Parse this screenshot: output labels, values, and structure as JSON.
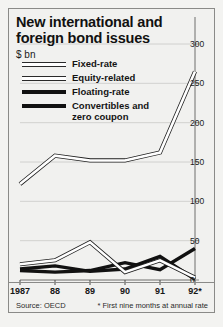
{
  "figure": {
    "title": "New international and\nforeign bond issues",
    "title_line1": "New international and",
    "title_line2": "foreign bond issues",
    "units": "$ bn",
    "source": "Source: OECD",
    "footnote": "* First nine months at annual rate"
  },
  "legend": {
    "items": [
      {
        "label": "Fixed-rate",
        "style": "hollow",
        "color": "#2a2a2a"
      },
      {
        "label": "Equity-related",
        "style": "hollow",
        "color": "#2a2a2a"
      },
      {
        "label": "Floating-rate",
        "style": "solid",
        "color": "#111111"
      },
      {
        "label": "Convertibles and",
        "label2": "zero coupon",
        "style": "solid",
        "color": "#111111"
      }
    ]
  },
  "axis": {
    "y_ticks": [
      300,
      250,
      200,
      150,
      100,
      50,
      0
    ],
    "x_ticks": [
      "1987",
      "88",
      "89",
      "90",
      "91",
      "92*"
    ]
  },
  "chart_data": {
    "type": "line",
    "title": "New international and foreign bond issues",
    "subtitle": "$ bn",
    "xlabel": "",
    "ylabel": "$ bn",
    "ylim": [
      0,
      300
    ],
    "grid": true,
    "legend_position": "top-left",
    "categories": [
      "1987",
      "88",
      "89",
      "90",
      "91",
      "92*"
    ],
    "series": [
      {
        "name": "Fixed-rate",
        "style": "hollow",
        "values": [
          122,
          158,
          152,
          152,
          162,
          265
        ]
      },
      {
        "name": "Equity-related",
        "style": "hollow",
        "values": [
          20,
          25,
          48,
          10,
          25,
          3
        ]
      },
      {
        "name": "Floating-rate",
        "style": "solid",
        "values": [
          14,
          18,
          11,
          14,
          30,
          1
        ]
      },
      {
        "name": "Convertibles and zero coupon",
        "style": "solid",
        "values": [
          12,
          10,
          12,
          22,
          13,
          40
        ]
      }
    ],
    "annotations": [
      "* First nine months at annual rate",
      "Source: OECD"
    ]
  }
}
